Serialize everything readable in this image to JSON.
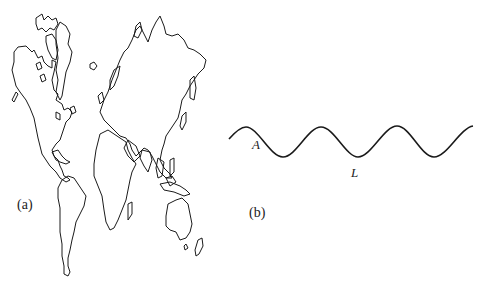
{
  "figure": {
    "panels": [
      {
        "id": "a",
        "label": "(a)",
        "content": "world-map-outline"
      },
      {
        "id": "b",
        "label": "(b)",
        "content": "sinusoidal-wave",
        "annotations": {
          "amplitude_label": "A",
          "wavelength_label": "L"
        }
      }
    ]
  },
  "colors": {
    "stroke": "#1a1a1a",
    "background": "#ffffff"
  }
}
